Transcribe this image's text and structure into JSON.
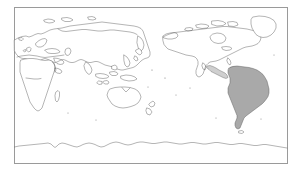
{
  "figure": {
    "kind": "world-map",
    "projection": "pacific-centered-equirectangular",
    "background_color": "#ffffff",
    "frame": {
      "border_color": "#9a9a9a",
      "fill_color": "#ffffff",
      "x": 14,
      "y": 7,
      "width": 274,
      "height": 157
    },
    "styles": {
      "coastline_color": "#5a5a5a",
      "land_fill_color": "#ffffff",
      "highlight_fill_color": "#a9a9a9",
      "tint_fill_color": "#cfcfcf"
    }
  },
  "regions": [
    {
      "id": "eurasia",
      "label": "Eurasia",
      "state": "unhighlighted"
    },
    {
      "id": "africa",
      "label": "Africa",
      "state": "unhighlighted"
    },
    {
      "id": "australia",
      "label": "Australia",
      "state": "unhighlighted"
    },
    {
      "id": "new-zealand",
      "label": "New Zealand",
      "state": "unhighlighted"
    },
    {
      "id": "southeast-asia-islands",
      "label": "Southeast Asia Islands",
      "state": "unhighlighted"
    },
    {
      "id": "japan",
      "label": "Japan",
      "state": "unhighlighted"
    },
    {
      "id": "north-america",
      "label": "North America",
      "state": "unhighlighted"
    },
    {
      "id": "greenland",
      "label": "Greenland",
      "state": "unhighlighted"
    },
    {
      "id": "central-america",
      "label": "Central America",
      "state": "tinted"
    },
    {
      "id": "south-america",
      "label": "South America",
      "state": "highlighted"
    },
    {
      "id": "antarctica",
      "label": "Antarctica",
      "state": "unhighlighted"
    },
    {
      "id": "british-isles",
      "label": "British Isles",
      "state": "unhighlighted"
    },
    {
      "id": "madagascar",
      "label": "Madagascar",
      "state": "unhighlighted"
    },
    {
      "id": "iceland",
      "label": "Iceland",
      "state": "unhighlighted"
    }
  ]
}
